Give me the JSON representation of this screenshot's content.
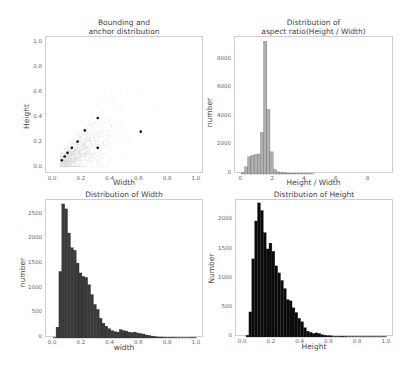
{
  "chart_data": [
    {
      "type": "scatter",
      "title": "Bounding and\nanchor distribution",
      "xlabel": "Width",
      "ylabel": "Height",
      "xlim": [
        0.0,
        1.0
      ],
      "ylim": [
        0.0,
        1.0
      ],
      "xticks": [
        "0.0",
        "0.2",
        "0.4",
        "0.6",
        "0.8",
        "1.0"
      ],
      "yticks": [
        "0.0",
        "0.2",
        "0.4",
        "0.6",
        "0.8",
        "1.0"
      ],
      "grid": false,
      "background_cloud": "dense light-grey points concentrated near diagonal, width 0-0.8, height 0-0.6",
      "anchors": [
        {
          "x": 0.06,
          "y": 0.06
        },
        {
          "x": 0.08,
          "y": 0.09
        },
        {
          "x": 0.1,
          "y": 0.12
        },
        {
          "x": 0.13,
          "y": 0.16
        },
        {
          "x": 0.17,
          "y": 0.21
        },
        {
          "x": 0.22,
          "y": 0.3
        },
        {
          "x": 0.31,
          "y": 0.4
        },
        {
          "x": 0.31,
          "y": 0.16
        },
        {
          "x": 0.61,
          "y": 0.29
        }
      ]
    },
    {
      "type": "bar",
      "title": "Distribution of\naspect ratio(Height / Width)",
      "xlabel": "Height / Width",
      "ylabel": "number",
      "xlim": [
        -0.4,
        9.6
      ],
      "ylim": [
        0,
        9600
      ],
      "xticks": [
        "0",
        "2",
        "4",
        "6",
        "8"
      ],
      "yticks": [
        "0",
        "2000",
        "4000",
        "6000",
        "8000"
      ],
      "bin_width": 0.2,
      "bin_start": 0.0,
      "values": [
        100,
        500,
        1200,
        1300,
        1350,
        1400,
        2900,
        9300,
        4500,
        1550,
        300,
        150,
        100,
        80,
        60,
        50,
        40,
        30,
        25,
        20,
        15,
        12,
        10
      ],
      "color": "#b0b0b0"
    },
    {
      "type": "bar",
      "title": "Distribution of Width",
      "xlabel": "width",
      "ylabel": "number",
      "xlim": [
        -0.05,
        1.05
      ],
      "ylim": [
        0,
        2800
      ],
      "xticks": [
        "0.0",
        "0.2",
        "0.4",
        "0.6",
        "0.8",
        "1.0"
      ],
      "yticks": [
        "0",
        "500",
        "1000",
        "1500",
        "2000",
        "2500"
      ],
      "bin_width": 0.02,
      "bin_start": 0.0,
      "values": [
        10,
        220,
        1350,
        2720,
        2620,
        2130,
        1830,
        1780,
        1520,
        1320,
        1250,
        1230,
        1080,
        880,
        680,
        580,
        400,
        300,
        240,
        190,
        150,
        130,
        120,
        170,
        150,
        140,
        120,
        110,
        120,
        100,
        90,
        80,
        60,
        50,
        40,
        30,
        20,
        20,
        15,
        10,
        10,
        10,
        10,
        5,
        5,
        5,
        5,
        5,
        10,
        5
      ],
      "color": "#3a3a3a"
    },
    {
      "type": "bar",
      "title": "Distribution of Height",
      "xlabel": "Height",
      "ylabel": "Number",
      "xlim": [
        -0.05,
        1.05
      ],
      "ylim": [
        0,
        2350
      ],
      "xticks": [
        "0.0",
        "0.2",
        "0.4",
        "0.6",
        "0.8",
        "1.0"
      ],
      "yticks": [
        "0",
        "500",
        "1000",
        "1500",
        "2000"
      ],
      "bin_width": 0.02,
      "bin_start": 0.0,
      "values": [
        0,
        30,
        430,
        1340,
        1990,
        2300,
        2170,
        1790,
        1510,
        1610,
        1470,
        1220,
        1100,
        970,
        830,
        640,
        620,
        500,
        420,
        320,
        260,
        160,
        100,
        80,
        60,
        70,
        60,
        40,
        30,
        20,
        20,
        10,
        10,
        10,
        15,
        10,
        5,
        5,
        5,
        5,
        5,
        5,
        5,
        5,
        5,
        5,
        5,
        5,
        5,
        5
      ],
      "color": "#0a0a0a"
    }
  ]
}
